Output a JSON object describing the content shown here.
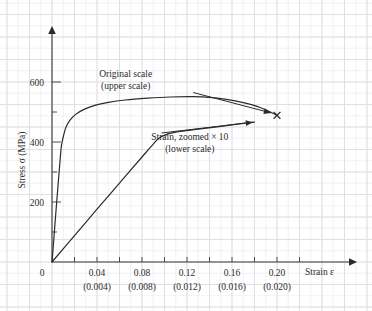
{
  "chart_data": {
    "type": "line",
    "title": "",
    "xlabel": "Strain ε",
    "ylabel": "Stress σ (MPa)",
    "xlim": [
      0,
      0.232
    ],
    "ylim": [
      0,
      660
    ],
    "grid": true,
    "legend_position": "inline-annotations",
    "x_tick_labels_upper": [
      "0",
      "0.04",
      "0.08",
      "0.12",
      "0.16",
      "0.20"
    ],
    "x_tick_values_upper": [
      0,
      0.04,
      0.08,
      0.12,
      0.16,
      0.2
    ],
    "x_tick_labels_lower": [
      "(0.004)",
      "(0.008)",
      "(0.012)",
      "(0.016)",
      "(0.020)"
    ],
    "x_tick_values_lower": [
      0.004,
      0.008,
      0.012,
      0.016,
      0.02
    ],
    "y_tick_labels": [
      "200",
      "400",
      "600"
    ],
    "y_tick_values": [
      200,
      400,
      600
    ],
    "origin_label": "0",
    "series": [
      {
        "name": "Original scale (upper scale)",
        "scale_note": "upper scale",
        "points": [
          [
            0.0,
            0
          ],
          [
            0.0015,
            70
          ],
          [
            0.003,
            145
          ],
          [
            0.0045,
            215
          ],
          [
            0.006,
            285
          ],
          [
            0.0072,
            340
          ],
          [
            0.0082,
            382
          ],
          [
            0.009,
            400
          ],
          [
            0.0105,
            425
          ],
          [
            0.0125,
            450
          ],
          [
            0.016,
            473
          ],
          [
            0.021,
            492
          ],
          [
            0.028,
            508
          ],
          [
            0.038,
            522
          ],
          [
            0.05,
            532
          ],
          [
            0.065,
            540
          ],
          [
            0.085,
            546
          ],
          [
            0.105,
            550
          ],
          [
            0.125,
            551
          ],
          [
            0.14,
            549
          ],
          [
            0.155,
            542
          ],
          [
            0.17,
            531
          ],
          [
            0.185,
            515
          ],
          [
            0.2,
            489
          ]
        ],
        "end_marker": "x",
        "end_point": [
          0.2,
          489
        ]
      },
      {
        "name": "Strain, zoomed × 10 (lower scale)",
        "scale_note": "lower scale",
        "points": [
          [
            0.0,
            0
          ],
          [
            0.02,
            88
          ],
          [
            0.04,
            176
          ],
          [
            0.06,
            263
          ],
          [
            0.08,
            350
          ],
          [
            0.09,
            393
          ],
          [
            0.0955,
            414
          ],
          [
            0.104,
            428
          ],
          [
            0.115,
            436
          ],
          [
            0.13,
            443
          ],
          [
            0.15,
            452
          ],
          [
            0.168,
            461
          ],
          [
            0.18,
            466
          ]
        ],
        "end_marker": "arrow",
        "end_point": [
          0.18,
          466
        ]
      }
    ],
    "annotations": [
      {
        "id": "upper-scale-annotation",
        "line1": "Original scale",
        "line2": "(upper scale)",
        "anchor_x": 0.0655,
        "anchor_y": 618,
        "leader": false
      },
      {
        "id": "lower-scale-annotation",
        "line1": "Strain, zoomed × 10",
        "line2": "(lower scale)",
        "anchor_x": 0.1225,
        "anchor_y": 408,
        "leader": false
      }
    ],
    "pointers": [
      {
        "id": "upper-curve-pointer",
        "from": [
          0.1255,
          565
        ],
        "to": [
          0.1945,
          497
        ],
        "description": "arrow from Original scale label toward fracture point"
      },
      {
        "id": "lower-curve-pointer",
        "from": [
          0.0975,
          430
        ],
        "to": [
          0.1785,
          466
        ],
        "description": "arrow along zoomed strain curve"
      }
    ],
    "colors": {
      "curve": "#2b2b2b",
      "axis": "#3a3a3a",
      "grid_minor": "#e9e9ee",
      "grid_major": "#dcdce4",
      "background": "#ffffff"
    }
  }
}
